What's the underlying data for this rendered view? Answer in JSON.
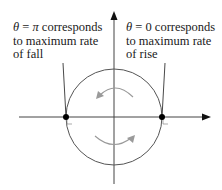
{
  "labels": {
    "left": {
      "theta": "θ",
      "eq": " = ",
      "value": "π",
      "rest": " corresponds",
      "line2": "to maximum rate",
      "line3": "of fall"
    },
    "right": {
      "theta": "θ",
      "eq": " = ",
      "value": "0",
      "rest": " corresponds",
      "line2": "to maximum rate",
      "line3": "of rise"
    }
  },
  "colors": {
    "axis": "#444444",
    "circle": "#555555",
    "rotation_arrow": "#9a9a9a",
    "point": "#000000",
    "text": "#1a1a1a"
  },
  "geometry": {
    "center": [
      114,
      117
    ],
    "radius": 48,
    "points": [
      {
        "name": "theta-pi",
        "x": 66,
        "y": 117
      },
      {
        "name": "theta-0",
        "x": 162,
        "y": 117
      }
    ]
  }
}
